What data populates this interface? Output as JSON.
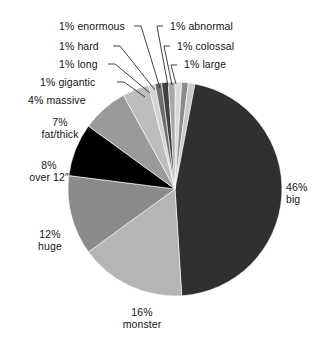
{
  "chart_data": {
    "type": "pie",
    "title": "",
    "subtitle": "",
    "xlabel": "",
    "ylabel": "",
    "legend_position": "none",
    "grid": false,
    "units": "percent",
    "categories": [
      "large",
      "colossal",
      "abnormal",
      "big",
      "monster",
      "huge",
      "over 12″",
      "fat/thick",
      "massive",
      "gigantic",
      "long",
      "hard",
      "enormous"
    ],
    "values": [
      1,
      1,
      1,
      46,
      16,
      12,
      8,
      7,
      4,
      1,
      1,
      1,
      1
    ],
    "slice_colors": [
      "#d9d9d9",
      "#8c8c8c",
      "#c9c9c9",
      "#303030",
      "#b5b5b5",
      "#8a8a8a",
      "#000000",
      "#9a9a9a",
      "#bdbdbd",
      "#d2d2d2",
      "#6e6e6e",
      "#3f3f3f",
      "#a8a8a8"
    ],
    "start_angle_deg": 0,
    "direction": "clockwise",
    "annotations": [
      {
        "id": "large",
        "percent_text": "1%",
        "name_text": "large",
        "full_text": "1% large"
      },
      {
        "id": "colossal",
        "percent_text": "1%",
        "name_text": "colossal",
        "full_text": "1% colossal"
      },
      {
        "id": "abnormal",
        "percent_text": "1%",
        "name_text": "abnormal",
        "full_text": "1% abnormal"
      },
      {
        "id": "big",
        "percent_text": "46%",
        "name_text": "big",
        "full_text": "46% big"
      },
      {
        "id": "monster",
        "percent_text": "16%",
        "name_text": "monster",
        "full_text": "16% monster"
      },
      {
        "id": "huge",
        "percent_text": "12%",
        "name_text": "huge",
        "full_text": "12% huge"
      },
      {
        "id": "over12",
        "percent_text": "8%",
        "name_text": "over 12″",
        "full_text": "8% over 12″"
      },
      {
        "id": "fatthick",
        "percent_text": "7%",
        "name_text": "fat/thick",
        "full_text": "7% fat/thick"
      },
      {
        "id": "massive",
        "percent_text": "4%",
        "name_text": "massive",
        "full_text": "4% massive"
      },
      {
        "id": "gigantic",
        "percent_text": "1%",
        "name_text": "gigantic",
        "full_text": "1% gigantic"
      },
      {
        "id": "long",
        "percent_text": "1%",
        "name_text": "long",
        "full_text": "1% long"
      },
      {
        "id": "hard",
        "percent_text": "1%",
        "name_text": "hard",
        "full_text": "1% hard"
      },
      {
        "id": "enormous",
        "percent_text": "1%",
        "name_text": "enormous",
        "full_text": "1% enormous"
      }
    ]
  },
  "labels": {
    "enormous": "1% enormous",
    "hard": "1% hard",
    "long": "1% long",
    "gigantic": "1% gigantic",
    "massive": "4% massive",
    "fatthick_l1": "7%",
    "fatthick_l2": "fat/thick",
    "over12_l1": "8%",
    "over12_l2": "over 12″",
    "huge_l1": "12%",
    "huge_l2": "huge",
    "monster_l1": "16%",
    "monster_l2": "monster",
    "big_l1": "46%",
    "big_l2": "big",
    "abnormal": "1% abnormal",
    "colossal": "1% colossal",
    "large": "1% large"
  },
  "style": {
    "background": "#ffffff",
    "text_color": "#141414",
    "leader_color": "#2b2b2b"
  }
}
